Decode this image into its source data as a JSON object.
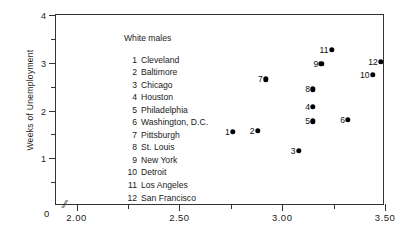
{
  "chart_data": {
    "type": "scatter",
    "title": "White males",
    "xlabel": "",
    "ylabel": "Weeks of Unemployment",
    "xlim": [
      1.9,
      3.5
    ],
    "ylim": [
      0,
      4
    ],
    "axis_break": "//",
    "grid": false,
    "x_ticks_major": [
      "2.00",
      "2.50",
      "3.00",
      "3.50"
    ],
    "x_tick_values": [
      2.0,
      2.5,
      3.0,
      3.5
    ],
    "x_ticks_minor": [
      2.25,
      2.75,
      3.25
    ],
    "y_ticks_major": [
      "0",
      "1",
      "2",
      "3",
      "4"
    ],
    "y_tick_values": [
      0,
      1,
      2,
      3,
      4
    ],
    "y_ticks_minor": [
      0.5,
      1.5,
      2.5,
      3.5
    ],
    "zero_label": "0",
    "points": [
      {
        "id": "1",
        "label": "Cleveland",
        "x": 2.76,
        "y": 1.56
      },
      {
        "id": "2",
        "label": "Baltimore",
        "x": 2.88,
        "y": 1.58
      },
      {
        "id": "3",
        "label": "Chicago",
        "x": 3.08,
        "y": 1.15
      },
      {
        "id": "4",
        "label": "Houston",
        "x": 3.15,
        "y": 2.08
      },
      {
        "id": "5",
        "label": "Philadelphia",
        "x": 3.15,
        "y": 1.77
      },
      {
        "id": "6",
        "label": "Washington, D.C.",
        "x": 3.32,
        "y": 1.81
      },
      {
        "id": "7",
        "label": "Pittsburgh",
        "x": 2.92,
        "y": 2.65
      },
      {
        "id": "8",
        "label": "St. Louis",
        "x": 3.15,
        "y": 2.44
      },
      {
        "id": "9",
        "label": "New York",
        "x": 3.19,
        "y": 2.98
      },
      {
        "id": "10",
        "label": "Detroit",
        "x": 3.44,
        "y": 2.75
      },
      {
        "id": "11",
        "label": "Los Angeles",
        "x": 3.24,
        "y": 3.27
      },
      {
        "id": "12",
        "label": "San Francisco",
        "x": 3.48,
        "y": 3.02
      }
    ]
  },
  "legend": {
    "title": "White males",
    "entries": [
      {
        "num": "1",
        "name": "Cleveland"
      },
      {
        "num": "2",
        "name": "Baltimore"
      },
      {
        "num": "3",
        "name": "Chicago"
      },
      {
        "num": "4",
        "name": "Houston"
      },
      {
        "num": "5",
        "name": "Philadelphia"
      },
      {
        "num": "6",
        "name": "Washington, D.C."
      },
      {
        "num": "7",
        "name": "Pittsburgh"
      },
      {
        "num": "8",
        "name": "St. Louis"
      },
      {
        "num": "9",
        "name": "New York"
      },
      {
        "num": "10",
        "name": "Detroit"
      },
      {
        "num": "11",
        "name": "Los Angeles"
      },
      {
        "num": "12",
        "name": "San Francisco"
      }
    ]
  }
}
